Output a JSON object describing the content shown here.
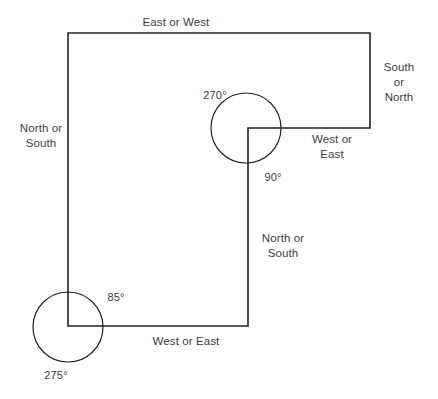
{
  "diagram": {
    "type": "surveying-bearing-traverse",
    "canvas": {
      "width": 438,
      "height": 399
    },
    "style": {
      "background_color": "#ffffff",
      "line_color": "#222222",
      "text_color": "#3c3c3c",
      "line_width": 1.6
    },
    "direction_labels": {
      "top": "East or West",
      "right": "South or\nNorth",
      "inner_right": "West or\nEast",
      "left": "North or\nSouth",
      "middle": "North or\nSouth",
      "bottom": "West or East"
    },
    "angle_labels": {
      "upper_left_of_circle": "270°",
      "upper_below_circle": "90°",
      "lower_above_circle": "85°",
      "lower_below_circle": "275°"
    },
    "geometry": {
      "path_points": [
        {
          "x": 68,
          "y": 326
        },
        {
          "x": 68,
          "y": 33
        },
        {
          "x": 370,
          "y": 33
        },
        {
          "x": 370,
          "y": 128
        },
        {
          "x": 248,
          "y": 128
        },
        {
          "x": 248,
          "y": 326
        },
        {
          "x": 68,
          "y": 326
        }
      ],
      "circles": [
        {
          "name": "upper-vertex-circle",
          "cx": 246,
          "cy": 128,
          "r": 35
        },
        {
          "name": "lower-vertex-circle",
          "cx": 68,
          "cy": 327,
          "r": 35
        }
      ]
    },
    "label_positions": {
      "top": {
        "x": 176,
        "y": 22
      },
      "right": {
        "x": 399,
        "y": 82
      },
      "inner_right": {
        "x": 332,
        "y": 147
      },
      "left": {
        "x": 41,
        "y": 136
      },
      "middle": {
        "x": 283,
        "y": 246
      },
      "bottom": {
        "x": 186,
        "y": 341
      },
      "angle_270": {
        "x": 215,
        "y": 95
      },
      "angle_90": {
        "x": 273,
        "y": 177
      },
      "angle_85": {
        "x": 116,
        "y": 297
      },
      "angle_275": {
        "x": 56,
        "y": 375
      }
    }
  }
}
